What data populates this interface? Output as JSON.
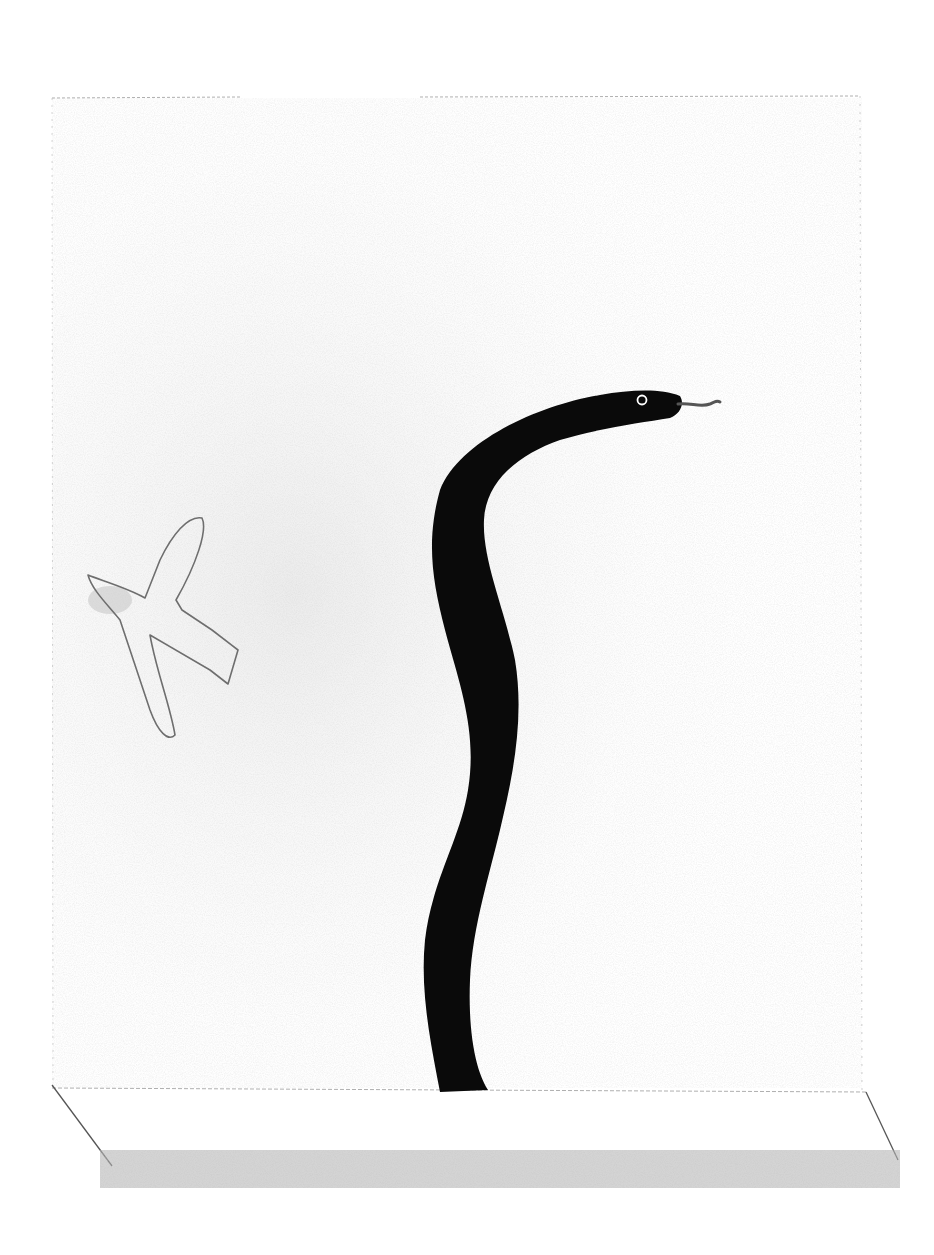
{
  "artwork": {
    "subject": "Pencil drawing of a black snake rising from a box-like stage with a small outlined bird flying on the left",
    "elements": [
      {
        "name": "frame",
        "description": "faint pencil rectangle frame"
      },
      {
        "name": "snake",
        "description": "solid black snake, S-curve body, head facing right with white eye and forked tongue"
      },
      {
        "name": "bird",
        "description": "outlined pencil bird with spread wings, shaded head on left"
      },
      {
        "name": "base",
        "description": "front face of box/stage with slanted side edges and graphite shading at bottom"
      }
    ],
    "colors": {
      "paper": "#ffffff",
      "snake": "#0a0a0a",
      "pencil": "#7a7a7a",
      "shading": "#b5b5b5",
      "wash": "#e6e6e6"
    }
  }
}
